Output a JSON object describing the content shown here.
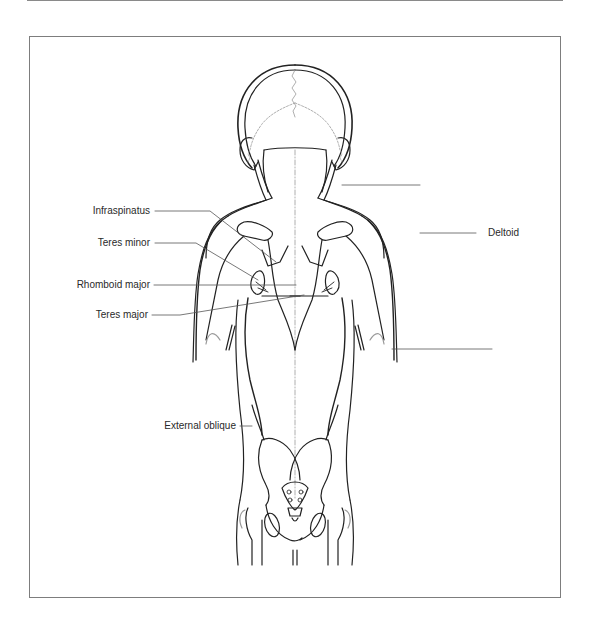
{
  "figure": {
    "type": "anatomical-diagram",
    "view": "posterior torso — superficial & deep back muscles",
    "colors": {
      "outline": "#222222",
      "leader": "#555555",
      "frame": "#7d7d7d",
      "suture": "#9a9a9a"
    }
  },
  "labels": {
    "infraspinatus": "Infraspinatus",
    "teres_minor": "Teres minor",
    "rhomboid_major": "Rhomboid major",
    "teres_major": "Teres major",
    "external_oblique": "External oblique",
    "deltoid": "Deltoid"
  },
  "unlabeled_leaders": [
    {
      "position": "neck/trapezius",
      "label": ""
    },
    {
      "position": "latissimus dorsi",
      "label": ""
    }
  ]
}
